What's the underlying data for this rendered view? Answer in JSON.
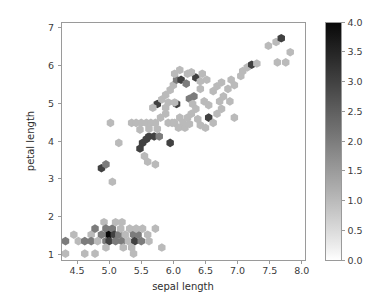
{
  "figure": {
    "width": 375,
    "height": 304,
    "background": "#ffffff",
    "spine_color": "#9a9a9a",
    "text_color": "#3b3b3b"
  },
  "chart_data": {
    "type": "heatmap",
    "subtype": "hexbin",
    "title": "",
    "xlabel": "sepal length",
    "ylabel": "petal length",
    "xlim": [
      4.25,
      8.05
    ],
    "ylim": [
      0.85,
      7.15
    ],
    "xticks": [
      4.5,
      5.0,
      5.5,
      6.0,
      6.5,
      7.0,
      7.5,
      8.0
    ],
    "xticklabels": [
      "4.5",
      "5.0",
      "5.5",
      "6.0",
      "6.5",
      "7.0",
      "7.5",
      "8.0"
    ],
    "yticks": [
      1,
      2,
      3,
      4,
      5,
      6,
      7
    ],
    "yticklabels": [
      "1",
      "2",
      "3",
      "4",
      "5",
      "6",
      "7"
    ],
    "grid": false,
    "legend": "none",
    "colormap": "Greys",
    "colorbar": {
      "label": "",
      "vmin": 0.0,
      "vmax": 4.0,
      "orientation": "vertical",
      "position": "right",
      "ticks": [
        0.0,
        0.5,
        1.0,
        1.5,
        2.0,
        2.5,
        3.0,
        3.5,
        4.0
      ],
      "ticklabels": [
        "0.0",
        "0.5",
        "1.0",
        "1.5",
        "2.0",
        "2.5",
        "3.0",
        "3.5",
        "4.0"
      ]
    },
    "hex_radius_px": 4.3,
    "bins": [
      {
        "x": 4.32,
        "y": 1.35,
        "c": 2
      },
      {
        "x": 4.32,
        "y": 1.02,
        "c": 1
      },
      {
        "x": 4.45,
        "y": 1.52,
        "c": 1
      },
      {
        "x": 4.52,
        "y": 1.35,
        "c": 1
      },
      {
        "x": 4.62,
        "y": 1.35,
        "c": 2
      },
      {
        "x": 4.62,
        "y": 1.02,
        "c": 1
      },
      {
        "x": 4.72,
        "y": 1.52,
        "c": 1
      },
      {
        "x": 4.72,
        "y": 1.35,
        "c": 2
      },
      {
        "x": 4.78,
        "y": 1.68,
        "c": 2
      },
      {
        "x": 4.82,
        "y": 1.35,
        "c": 1
      },
      {
        "x": 4.88,
        "y": 1.52,
        "c": 2
      },
      {
        "x": 4.92,
        "y": 1.85,
        "c": 1
      },
      {
        "x": 4.95,
        "y": 1.68,
        "c": 2
      },
      {
        "x": 4.95,
        "y": 1.35,
        "c": 2
      },
      {
        "x": 5.0,
        "y": 1.52,
        "c": 4
      },
      {
        "x": 5.0,
        "y": 1.35,
        "c": 3
      },
      {
        "x": 5.05,
        "y": 1.68,
        "c": 2
      },
      {
        "x": 5.08,
        "y": 1.52,
        "c": 3
      },
      {
        "x": 5.1,
        "y": 1.35,
        "c": 2
      },
      {
        "x": 5.15,
        "y": 1.52,
        "c": 2
      },
      {
        "x": 5.18,
        "y": 1.68,
        "c": 1
      },
      {
        "x": 5.2,
        "y": 1.35,
        "c": 2
      },
      {
        "x": 5.25,
        "y": 1.52,
        "c": 1
      },
      {
        "x": 5.3,
        "y": 1.35,
        "c": 1
      },
      {
        "x": 5.32,
        "y": 1.68,
        "c": 1
      },
      {
        "x": 5.38,
        "y": 1.52,
        "c": 2
      },
      {
        "x": 5.4,
        "y": 1.35,
        "c": 3
      },
      {
        "x": 5.45,
        "y": 1.52,
        "c": 2
      },
      {
        "x": 5.5,
        "y": 1.35,
        "c": 2
      },
      {
        "x": 5.52,
        "y": 1.68,
        "c": 1
      },
      {
        "x": 5.6,
        "y": 1.52,
        "c": 1
      },
      {
        "x": 5.62,
        "y": 1.35,
        "c": 1
      },
      {
        "x": 5.72,
        "y": 1.68,
        "c": 1
      },
      {
        "x": 5.82,
        "y": 1.18,
        "c": 1
      },
      {
        "x": 4.95,
        "y": 1.18,
        "c": 1
      },
      {
        "x": 5.22,
        "y": 1.18,
        "c": 1
      },
      {
        "x": 5.35,
        "y": 1.18,
        "c": 1
      },
      {
        "x": 4.78,
        "y": 1.02,
        "c": 1
      },
      {
        "x": 5.1,
        "y": 1.85,
        "c": 1
      },
      {
        "x": 4.88,
        "y": 3.28,
        "c": 3
      },
      {
        "x": 4.95,
        "y": 3.38,
        "c": 2
      },
      {
        "x": 5.05,
        "y": 2.92,
        "c": 1
      },
      {
        "x": 5.02,
        "y": 4.48,
        "c": 1
      },
      {
        "x": 5.15,
        "y": 3.95,
        "c": 1
      },
      {
        "x": 5.35,
        "y": 4.48,
        "c": 1
      },
      {
        "x": 5.42,
        "y": 4.48,
        "c": 1
      },
      {
        "x": 5.5,
        "y": 4.48,
        "c": 1
      },
      {
        "x": 5.58,
        "y": 4.48,
        "c": 1
      },
      {
        "x": 5.65,
        "y": 4.48,
        "c": 1
      },
      {
        "x": 5.72,
        "y": 4.48,
        "c": 1
      },
      {
        "x": 5.48,
        "y": 3.8,
        "c": 3
      },
      {
        "x": 5.52,
        "y": 3.95,
        "c": 3
      },
      {
        "x": 5.58,
        "y": 4.05,
        "c": 3
      },
      {
        "x": 5.62,
        "y": 4.12,
        "c": 3
      },
      {
        "x": 5.7,
        "y": 4.12,
        "c": 3
      },
      {
        "x": 5.78,
        "y": 4.12,
        "c": 2
      },
      {
        "x": 5.55,
        "y": 3.6,
        "c": 1
      },
      {
        "x": 5.6,
        "y": 3.45,
        "c": 1
      },
      {
        "x": 5.72,
        "y": 3.38,
        "c": 1
      },
      {
        "x": 5.75,
        "y": 4.98,
        "c": 3
      },
      {
        "x": 5.68,
        "y": 4.88,
        "c": 1
      },
      {
        "x": 5.8,
        "y": 4.62,
        "c": 1
      },
      {
        "x": 5.88,
        "y": 4.72,
        "c": 1
      },
      {
        "x": 5.92,
        "y": 4.48,
        "c": 1
      },
      {
        "x": 5.98,
        "y": 4.48,
        "c": 1
      },
      {
        "x": 5.95,
        "y": 3.95,
        "c": 3
      },
      {
        "x": 6.02,
        "y": 4.48,
        "c": 1
      },
      {
        "x": 6.05,
        "y": 4.98,
        "c": 3
      },
      {
        "x": 6.1,
        "y": 4.62,
        "c": 1
      },
      {
        "x": 6.15,
        "y": 4.48,
        "c": 1
      },
      {
        "x": 5.82,
        "y": 5.1,
        "c": 1
      },
      {
        "x": 5.88,
        "y": 5.22,
        "c": 1
      },
      {
        "x": 5.95,
        "y": 5.35,
        "c": 1
      },
      {
        "x": 6.0,
        "y": 5.48,
        "c": 1
      },
      {
        "x": 6.05,
        "y": 5.62,
        "c": 2
      },
      {
        "x": 6.12,
        "y": 5.62,
        "c": 3
      },
      {
        "x": 6.2,
        "y": 5.52,
        "c": 2
      },
      {
        "x": 6.22,
        "y": 5.78,
        "c": 1
      },
      {
        "x": 6.1,
        "y": 5.88,
        "c": 1
      },
      {
        "x": 6.02,
        "y": 5.78,
        "c": 1
      },
      {
        "x": 5.88,
        "y": 4.88,
        "c": 1
      },
      {
        "x": 5.92,
        "y": 5.02,
        "c": 1
      },
      {
        "x": 6.25,
        "y": 5.12,
        "c": 2
      },
      {
        "x": 6.32,
        "y": 5.18,
        "c": 2
      },
      {
        "x": 6.3,
        "y": 4.98,
        "c": 1
      },
      {
        "x": 6.35,
        "y": 4.85,
        "c": 1
      },
      {
        "x": 6.28,
        "y": 4.72,
        "c": 1
      },
      {
        "x": 6.22,
        "y": 4.62,
        "c": 1
      },
      {
        "x": 6.35,
        "y": 5.68,
        "c": 3
      },
      {
        "x": 6.42,
        "y": 5.58,
        "c": 1
      },
      {
        "x": 6.28,
        "y": 5.82,
        "c": 1
      },
      {
        "x": 6.45,
        "y": 5.78,
        "c": 1
      },
      {
        "x": 6.52,
        "y": 5.62,
        "c": 1
      },
      {
        "x": 6.48,
        "y": 5.05,
        "c": 1
      },
      {
        "x": 6.55,
        "y": 4.95,
        "c": 1
      },
      {
        "x": 6.55,
        "y": 4.62,
        "c": 3
      },
      {
        "x": 6.62,
        "y": 4.48,
        "c": 1
      },
      {
        "x": 6.68,
        "y": 4.72,
        "c": 1
      },
      {
        "x": 6.75,
        "y": 4.85,
        "c": 1
      },
      {
        "x": 6.72,
        "y": 5.05,
        "c": 1
      },
      {
        "x": 6.78,
        "y": 5.18,
        "c": 1
      },
      {
        "x": 6.62,
        "y": 5.32,
        "c": 1
      },
      {
        "x": 6.68,
        "y": 5.45,
        "c": 1
      },
      {
        "x": 6.75,
        "y": 5.55,
        "c": 1
      },
      {
        "x": 6.85,
        "y": 5.38,
        "c": 1
      },
      {
        "x": 6.9,
        "y": 5.62,
        "c": 1
      },
      {
        "x": 6.95,
        "y": 5.48,
        "c": 1
      },
      {
        "x": 6.88,
        "y": 5.05,
        "c": 1
      },
      {
        "x": 6.95,
        "y": 4.62,
        "c": 1
      },
      {
        "x": 7.08,
        "y": 5.85,
        "c": 1
      },
      {
        "x": 7.15,
        "y": 5.95,
        "c": 1
      },
      {
        "x": 7.22,
        "y": 6.02,
        "c": 3
      },
      {
        "x": 7.3,
        "y": 6.05,
        "c": 1
      },
      {
        "x": 7.05,
        "y": 5.72,
        "c": 1
      },
      {
        "x": 7.48,
        "y": 6.52,
        "c": 1
      },
      {
        "x": 7.6,
        "y": 6.62,
        "c": 1
      },
      {
        "x": 7.68,
        "y": 6.72,
        "c": 3
      },
      {
        "x": 7.75,
        "y": 6.08,
        "c": 1
      },
      {
        "x": 7.82,
        "y": 6.35,
        "c": 1
      },
      {
        "x": 7.62,
        "y": 6.08,
        "c": 1
      },
      {
        "x": 6.42,
        "y": 4.42,
        "c": 1
      },
      {
        "x": 6.5,
        "y": 4.35,
        "c": 1
      },
      {
        "x": 5.75,
        "y": 4.32,
        "c": 1
      },
      {
        "x": 5.62,
        "y": 4.32,
        "c": 1
      },
      {
        "x": 5.48,
        "y": 4.3,
        "c": 1
      },
      {
        "x": 6.08,
        "y": 4.35,
        "c": 1
      },
      {
        "x": 6.18,
        "y": 4.35,
        "c": 1
      },
      {
        "x": 6.25,
        "y": 4.45,
        "c": 1
      },
      {
        "x": 5.42,
        "y": 1.68,
        "c": 1
      },
      {
        "x": 5.2,
        "y": 1.85,
        "c": 1
      },
      {
        "x": 6.02,
        "y": 5.02,
        "c": 1
      },
      {
        "x": 6.42,
        "y": 5.38,
        "c": 1
      },
      {
        "x": 5.38,
        "y": 1.02,
        "c": 1
      },
      {
        "x": 6.38,
        "y": 4.58,
        "c": 1
      }
    ]
  }
}
